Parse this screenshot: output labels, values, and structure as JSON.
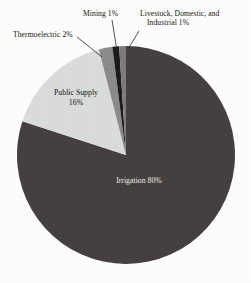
{
  "chart_data": {
    "type": "pie",
    "title": "",
    "categories": [
      "Irrigation",
      "Public Supply",
      "Thermoelectric",
      "Mining",
      "Livestock, Domestic, and Industrial"
    ],
    "values": [
      80,
      16,
      2,
      1,
      1
    ],
    "unit": "%",
    "legend": "none",
    "grid": false,
    "slices": [
      {
        "name": "Irrigation",
        "value": 80,
        "label": "Irrigation 80%",
        "color": "#464041",
        "label_position": "inside",
        "start_angle_deg": 0,
        "end_angle_deg": 288
      },
      {
        "name": "Public Supply",
        "value": 16,
        "label_line1": "Public Supply",
        "label_line2": "16%",
        "color": "#dcdedd",
        "label_position": "inside",
        "start_angle_deg": 288,
        "end_angle_deg": 345.6
      },
      {
        "name": "Thermoelectric",
        "value": 2,
        "label": "Thermoelectric 2%",
        "color": "#8d8c8b",
        "label_position": "callout",
        "start_angle_deg": 345.6,
        "end_angle_deg": 352.8
      },
      {
        "name": "Mining",
        "value": 1,
        "label": "Mining 1%",
        "color": "#1d1b1b",
        "label_position": "callout",
        "start_angle_deg": 352.8,
        "end_angle_deg": 356.4
      },
      {
        "name": "Livestock, Domestic, and Industrial",
        "value": 1,
        "label_line1": "Livestock, Domestic, and",
        "label_line2": "Industrial 1%",
        "color": "#7e7d7c",
        "label_position": "callout",
        "start_angle_deg": 356.4,
        "end_angle_deg": 360
      }
    ]
  },
  "colors": {
    "background": "#ffffff",
    "irrigation": "#464041",
    "public_supply": "#dcdedd",
    "thermoelectric": "#8d8c8b",
    "mining": "#1d1b1b",
    "livestock": "#7e7d7c",
    "text_dark": "#15110f",
    "text_light": "#f2f0ee",
    "leader_line": "#2b2726"
  }
}
